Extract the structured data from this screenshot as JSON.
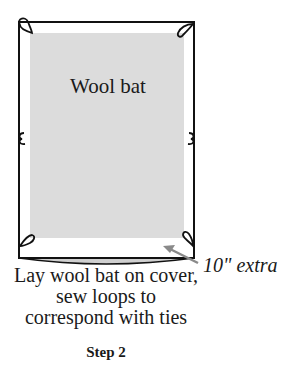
{
  "diagram": {
    "bat_label": "Wool bat",
    "extra_label": "10\" extra",
    "caption_lines": [
      "Lay wool bat on cover,",
      "sew loops to",
      "correspond with ties"
    ],
    "step_label": "Step 2",
    "colors": {
      "outline": "#111111",
      "bat_fill": "#dcdcdc",
      "arrow": "#8a8a8a",
      "bottom_curve_fill": "#cfcfcf"
    },
    "loops": [
      {
        "position": "top-left"
      },
      {
        "position": "top-right"
      },
      {
        "position": "middle-left"
      },
      {
        "position": "middle-right"
      },
      {
        "position": "bottom-left"
      },
      {
        "position": "bottom-right"
      }
    ]
  }
}
